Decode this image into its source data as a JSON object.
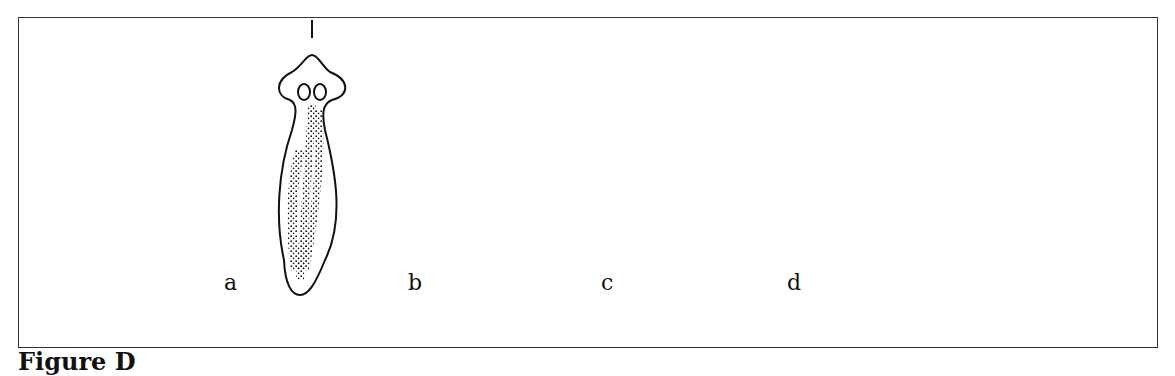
{
  "figure": {
    "caption": "Figure D",
    "colors": {
      "ink": "#111111",
      "frame": "#333333",
      "background": "#ffffff"
    }
  },
  "specimens": [
    {
      "label": "a",
      "cuts": [
        "short vertical mark above head"
      ]
    },
    {
      "label": "b",
      "cuts": [
        "vertical midline cut (dashed)",
        "horizontal transverse cut (dashed)"
      ]
    },
    {
      "label": "c",
      "cuts": [
        "vertical midline cut (dashed)"
      ]
    },
    {
      "label": "d",
      "cuts": [
        "horizontal cut below head (dashed)",
        "horizontal cut mid-body (dashed)"
      ]
    }
  ]
}
